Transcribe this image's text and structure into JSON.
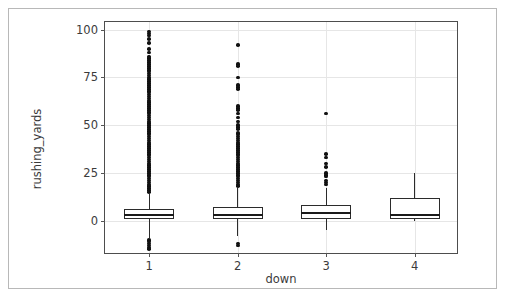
{
  "chart_data": {
    "type": "box",
    "title": "",
    "xlabel": "down",
    "ylabel": "rushing_yards",
    "categories": [
      "1",
      "2",
      "3",
      "4"
    ],
    "yticks": [
      0,
      25,
      50,
      75,
      100
    ],
    "ytick_labels": [
      "0",
      "25",
      "50",
      "75",
      "100"
    ],
    "xtick_labels": [
      "1",
      "2",
      "3",
      "4"
    ],
    "ylim": [
      -18,
      104
    ],
    "grid": true,
    "legend": null,
    "boxes": [
      {
        "category": "1",
        "q1": 1,
        "median": 3,
        "q3": 6,
        "whisker_low": -9,
        "whisker_high": 14,
        "fliers": [
          99,
          98,
          97,
          95,
          93,
          90,
          88,
          86,
          85,
          84,
          83,
          82,
          81,
          80,
          79,
          78,
          77,
          76,
          75,
          74,
          73,
          72,
          71,
          70,
          69,
          68,
          67,
          66,
          65,
          64,
          63,
          62,
          61,
          60,
          59,
          58,
          57,
          56,
          55,
          54,
          53,
          52,
          51,
          50,
          49,
          48,
          47,
          46,
          45,
          44,
          43,
          42,
          41,
          40,
          39,
          38,
          37,
          36,
          35,
          34,
          33,
          32,
          31,
          30,
          29,
          28,
          27,
          26,
          25,
          24,
          23,
          22,
          21,
          20,
          19,
          18,
          17,
          16,
          15,
          -10,
          -11,
          -12,
          -13,
          -14,
          -15
        ]
      },
      {
        "category": "2",
        "q1": 1,
        "median": 3,
        "q3": 7,
        "whisker_low": -8,
        "whisker_high": 17,
        "fliers": [
          92,
          82,
          81,
          75,
          71,
          70,
          69,
          60,
          59,
          58,
          56,
          54,
          52,
          50,
          49,
          48,
          46,
          45,
          44,
          43,
          42,
          41,
          40,
          39,
          38,
          37,
          36,
          35,
          34,
          33,
          32,
          31,
          30,
          29,
          28,
          27,
          26,
          25,
          24,
          23,
          22,
          21,
          20,
          19,
          18,
          -12,
          -13
        ]
      },
      {
        "category": "3",
        "q1": 1,
        "median": 4,
        "q3": 8,
        "whisker_low": -5,
        "whisker_high": 17,
        "fliers": [
          56,
          35,
          33,
          30,
          28,
          25,
          24,
          23,
          21,
          20,
          19
        ]
      },
      {
        "category": "4",
        "q1": 1,
        "median": 3,
        "q3": 12,
        "whisker_low": 0,
        "whisker_high": 25,
        "fliers": []
      }
    ]
  }
}
